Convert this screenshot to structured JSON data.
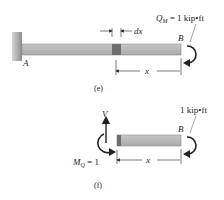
{
  "figure_e": {
    "caption": "(e)",
    "point_a": "A",
    "point_b": "B",
    "element_label": "dx",
    "dimension_label": "x",
    "moment_symbol": "Q",
    "moment_subscript": "M",
    "moment_value": " = 1 kip•ft"
  },
  "figure_f": {
    "caption": "(f)",
    "point_b": "B",
    "shear_label": "V",
    "dimension_label": "x",
    "end_moment_label": "1 kip•ft",
    "internal_moment_symbol": "M",
    "internal_moment_subscript": "Q",
    "internal_moment_value": " = 1"
  },
  "colors": {
    "beam": "#b8b8b8",
    "beam_light": "#d0d0d0",
    "element": "#6e6e6e",
    "wall": "#a8a8a8",
    "line": "#222222"
  }
}
